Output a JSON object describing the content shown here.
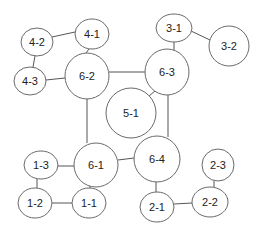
{
  "diagram": {
    "type": "network-graph",
    "nodes": [
      {
        "id": "4-2",
        "label": "4-2",
        "cx": 37,
        "cy": 42,
        "rx": 16,
        "ry": 14
      },
      {
        "id": "4-1",
        "label": "4-1",
        "cx": 92,
        "cy": 34,
        "rx": 17,
        "ry": 15
      },
      {
        "id": "4-3",
        "label": "4-3",
        "cx": 30,
        "cy": 81,
        "rx": 16,
        "ry": 14
      },
      {
        "id": "6-2",
        "label": "6-2",
        "cx": 87,
        "cy": 76,
        "rx": 22,
        "ry": 23
      },
      {
        "id": "3-1",
        "label": "3-1",
        "cx": 174,
        "cy": 28,
        "rx": 18,
        "ry": 14
      },
      {
        "id": "3-2",
        "label": "3-2",
        "cx": 229,
        "cy": 46,
        "rx": 20,
        "ry": 20
      },
      {
        "id": "6-3",
        "label": "6-3",
        "cx": 167,
        "cy": 72,
        "rx": 22,
        "ry": 23
      },
      {
        "id": "5-1",
        "label": "5-1",
        "cx": 131,
        "cy": 113,
        "rx": 25,
        "ry": 25
      },
      {
        "id": "6-1",
        "label": "6-1",
        "cx": 96,
        "cy": 165,
        "rx": 22,
        "ry": 22
      },
      {
        "id": "6-4",
        "label": "6-4",
        "cx": 157,
        "cy": 159,
        "rx": 23,
        "ry": 23
      },
      {
        "id": "1-3",
        "label": "1-3",
        "cx": 41,
        "cy": 165,
        "rx": 17,
        "ry": 14
      },
      {
        "id": "1-2",
        "label": "1-2",
        "cx": 35,
        "cy": 203,
        "rx": 17,
        "ry": 15
      },
      {
        "id": "1-1",
        "label": "1-1",
        "cx": 89,
        "cy": 203,
        "rx": 17,
        "ry": 15
      },
      {
        "id": "2-1",
        "label": "2-1",
        "cx": 157,
        "cy": 207,
        "rx": 17,
        "ry": 15
      },
      {
        "id": "2-3",
        "label": "2-3",
        "cx": 218,
        "cy": 165,
        "rx": 16,
        "ry": 16
      },
      {
        "id": "2-2",
        "label": "2-2",
        "cx": 210,
        "cy": 202,
        "rx": 18,
        "ry": 15
      }
    ],
    "edges": [
      {
        "from": "4-2",
        "to": "4-1",
        "points": [
          [
            52,
            37
          ],
          [
            75,
            32
          ]
        ]
      },
      {
        "from": "4-2",
        "to": "4-3",
        "points": [
          [
            35,
            56
          ],
          [
            33,
            67
          ]
        ]
      },
      {
        "from": "4-3",
        "to": "6-2",
        "points": [
          [
            46,
            80
          ],
          [
            65,
            78
          ]
        ]
      },
      {
        "from": "4-1",
        "to": "6-2",
        "points": [
          [
            89,
            49
          ],
          [
            86,
            53
          ]
        ]
      },
      {
        "from": "6-2",
        "to": "6-3",
        "points": [
          [
            109,
            72
          ],
          [
            145,
            72
          ]
        ]
      },
      {
        "from": "3-1",
        "to": "3-2",
        "points": [
          [
            191,
            31
          ],
          [
            210,
            40
          ]
        ]
      },
      {
        "from": "3-1",
        "to": "6-3",
        "points": [
          [
            174,
            42
          ],
          [
            174,
            50
          ]
        ]
      },
      {
        "from": "6-3",
        "to": "5-1",
        "points": [
          [
            155,
            91
          ],
          [
            149,
            96
          ]
        ]
      },
      {
        "from": "6-2",
        "to": "6-1",
        "points": [
          [
            87,
            99
          ],
          [
            87,
            143
          ]
        ]
      },
      {
        "from": "6-3",
        "to": "6-4",
        "points": [
          [
            168,
            95
          ],
          [
            168,
            137
          ]
        ]
      },
      {
        "from": "6-1",
        "to": "6-4",
        "points": [
          [
            118,
            160
          ],
          [
            134,
            158
          ]
        ]
      },
      {
        "from": "1-3",
        "to": "6-1",
        "points": [
          [
            58,
            166
          ],
          [
            74,
            166
          ]
        ]
      },
      {
        "from": "1-3",
        "to": "1-2",
        "points": [
          [
            37,
            179
          ],
          [
            37,
            188
          ]
        ]
      },
      {
        "from": "1-2",
        "to": "1-1",
        "points": [
          [
            52,
            203
          ],
          [
            72,
            203
          ]
        ]
      },
      {
        "from": "6-1",
        "to": "1-1",
        "points": [
          [
            90,
            186
          ],
          [
            90,
            188
          ]
        ]
      },
      {
        "from": "6-4",
        "to": "2-1",
        "points": [
          [
            156,
            182
          ],
          [
            156,
            192
          ]
        ]
      },
      {
        "from": "2-1",
        "to": "2-2",
        "points": [
          [
            174,
            204
          ],
          [
            192,
            203
          ]
        ]
      },
      {
        "from": "2-3",
        "to": "2-2",
        "points": [
          [
            214,
            181
          ],
          [
            214,
            187
          ]
        ]
      }
    ]
  }
}
